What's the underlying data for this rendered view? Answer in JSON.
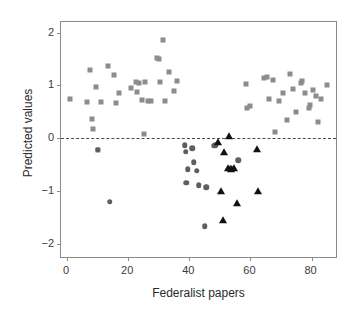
{
  "chart_data": {
    "type": "scatter",
    "title": "",
    "xlabel": "Federalist papers",
    "ylabel": "Predicted values",
    "xlim": [
      -2,
      88
    ],
    "ylim": [
      -2.25,
      2.2
    ],
    "xticks": [
      0,
      20,
      40,
      60,
      80
    ],
    "xticklabels": [
      "0",
      "20",
      "40",
      "60",
      "80"
    ],
    "yticks": [
      2,
      1,
      0,
      -1,
      -2
    ],
    "yticklabels": [
      "2",
      "1",
      "0",
      "−1",
      "−2"
    ],
    "grid": false,
    "legend": false,
    "annotations": [
      {
        "type": "hline",
        "y": 0,
        "style": "dashed",
        "color": "#4a4a4a"
      }
    ],
    "colors": {
      "square": "#8c8c8c",
      "circle": "#5e5e5e",
      "triangle": "#111111",
      "axis": "#8a8a8a",
      "text": "#2b2b2b"
    },
    "series": [
      {
        "name": "squares",
        "marker": "square",
        "color": "#8c8c8c",
        "points": [
          [
            1,
            0.74
          ],
          [
            6.5,
            0.68
          ],
          [
            7.5,
            1.3
          ],
          [
            8,
            0.37
          ],
          [
            8.5,
            0.18
          ],
          [
            9.5,
            0.97
          ],
          [
            10,
            -0.22
          ],
          [
            11,
            0.68
          ],
          [
            13.5,
            1.36
          ],
          [
            15.5,
            1.19
          ],
          [
            16,
            0.66
          ],
          [
            17,
            0.86
          ],
          [
            21,
            0.95
          ],
          [
            22.5,
            1.06
          ],
          [
            23,
            0.87
          ],
          [
            23.5,
            1.04
          ],
          [
            24.5,
            0.72
          ],
          [
            25,
            0.08
          ],
          [
            25.5,
            1.07
          ],
          [
            26.5,
            0.7
          ],
          [
            27.5,
            0.7
          ],
          [
            29.5,
            1.52
          ],
          [
            30,
            1.5
          ],
          [
            30.5,
            1.06
          ],
          [
            31.5,
            1.85
          ],
          [
            32,
            0.71
          ],
          [
            33.5,
            1.25
          ],
          [
            35,
            0.9
          ],
          [
            36,
            1.08
          ],
          [
            58.5,
            1.02
          ],
          [
            58.8,
            0.57
          ],
          [
            60,
            0.61
          ],
          [
            64.5,
            1.14
          ],
          [
            65.5,
            1.16
          ],
          [
            66,
            0.75
          ],
          [
            67.5,
            1.11
          ],
          [
            68,
            0.12
          ],
          [
            69.5,
            0.71
          ],
          [
            70.5,
            0.85
          ],
          [
            72,
            0.35
          ],
          [
            73,
            1.22
          ],
          [
            74,
            0.94
          ],
          [
            75,
            0.5
          ],
          [
            76.5,
            1.04
          ],
          [
            77,
            1.09
          ],
          [
            78,
            0.85
          ],
          [
            79,
            0.57
          ],
          [
            79.5,
            0.63
          ],
          [
            80.5,
            0.92
          ],
          [
            81.5,
            0.8
          ],
          [
            82,
            0.31
          ],
          [
            83,
            0.74
          ],
          [
            85,
            1.01
          ]
        ]
      },
      {
        "name": "circles",
        "marker": "circle",
        "color": "#5e5e5e",
        "points": [
          [
            10,
            -0.22
          ],
          [
            14,
            -1.2
          ],
          [
            38.5,
            -0.13
          ],
          [
            38.8,
            -0.26
          ],
          [
            39.5,
            -0.59
          ],
          [
            39,
            -0.84
          ],
          [
            41,
            -0.19
          ],
          [
            41.5,
            -0.46
          ],
          [
            42.5,
            -0.62
          ],
          [
            43,
            -0.89
          ],
          [
            45,
            -1.67
          ],
          [
            45.5,
            -0.93
          ],
          [
            48,
            -0.14
          ],
          [
            48.5,
            -0.13
          ],
          [
            56,
            -0.42
          ],
          [
            53.5,
            -0.57
          ]
        ]
      },
      {
        "name": "triangles",
        "marker": "triangle",
        "color": "#111111",
        "points": [
          [
            49.5,
            -0.08
          ],
          [
            53,
            0.05
          ],
          [
            51.5,
            -0.26
          ],
          [
            50.5,
            -1.0
          ],
          [
            51,
            -1.54
          ],
          [
            52.5,
            -0.57
          ],
          [
            53.5,
            -0.58
          ],
          [
            54.5,
            -0.57
          ],
          [
            55.5,
            -1.22
          ],
          [
            62,
            -0.21
          ],
          [
            62.5,
            -1.0
          ]
        ]
      }
    ]
  }
}
